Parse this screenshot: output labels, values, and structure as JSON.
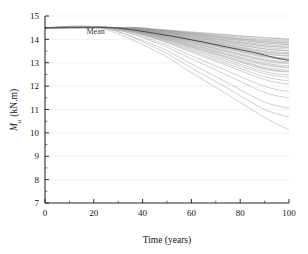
{
  "chart_data": {
    "type": "line",
    "title": "",
    "xlabel": "Time (years)",
    "ylabel": "M_u (kN.m)",
    "ylabel_parts": {
      "symbol": "M",
      "subscript": "u",
      "units": "(kN.m)"
    },
    "xlim": [
      0,
      100
    ],
    "ylim": [
      7,
      15
    ],
    "xticks": [
      0,
      20,
      40,
      60,
      80,
      100
    ],
    "yticks": [
      7,
      8,
      9,
      10,
      11,
      12,
      13,
      14,
      15
    ],
    "xtick_labels": [
      "0",
      "20",
      "40",
      "60",
      "80",
      "100"
    ],
    "ytick_labels": [
      "7",
      "8",
      "9",
      "10",
      "11",
      "12",
      "13",
      "14",
      "15"
    ],
    "x_minor_interval": 10,
    "y_minor_interval": 0.5,
    "grid": {
      "horizontal": true,
      "vertical": false,
      "color": "#e8eef2"
    },
    "legend": {
      "position": "inline-annotation",
      "entries": [
        "Mean"
      ]
    },
    "annotations": [
      {
        "text": "Mean",
        "x": 17,
        "y": 14.22
      }
    ],
    "initial_value": 14.5,
    "colors": {
      "samples": "#9a9a9a",
      "mean": "#4a4a4a",
      "axis": "#2b2b2b"
    },
    "series": [
      {
        "name": "Mean",
        "emphasis": true,
        "onset": 28,
        "x": [
          0,
          10,
          20,
          28,
          35,
          45,
          55,
          65,
          75,
          85,
          95,
          100
        ],
        "values": [
          14.5,
          14.5,
          14.5,
          14.5,
          14.42,
          14.26,
          14.08,
          13.88,
          13.66,
          13.45,
          13.2,
          13.1
        ]
      },
      {
        "name": "sample-1",
        "onset": 34,
        "x": [
          0,
          34,
          45,
          60,
          75,
          90,
          100
        ],
        "values": [
          14.5,
          14.5,
          14.43,
          14.3,
          14.18,
          14.06,
          14.0
        ]
      },
      {
        "name": "sample-2",
        "onset": 33,
        "x": [
          0,
          33,
          45,
          60,
          75,
          90,
          100
        ],
        "values": [
          14.5,
          14.5,
          14.42,
          14.28,
          14.14,
          14.0,
          13.95
        ]
      },
      {
        "name": "sample-3",
        "onset": 35,
        "x": [
          0,
          35,
          45,
          60,
          75,
          90,
          100
        ],
        "values": [
          14.5,
          14.5,
          14.42,
          14.27,
          14.1,
          13.96,
          13.9
        ]
      },
      {
        "name": "sample-4",
        "onset": 32,
        "x": [
          0,
          32,
          45,
          60,
          75,
          90,
          100
        ],
        "values": [
          14.5,
          14.5,
          14.4,
          14.24,
          14.06,
          13.9,
          13.84
        ]
      },
      {
        "name": "sample-5",
        "onset": 31,
        "x": [
          0,
          31,
          45,
          60,
          75,
          90,
          100
        ],
        "values": [
          14.5,
          14.5,
          14.38,
          14.2,
          14.01,
          13.84,
          13.78
        ]
      },
      {
        "name": "sample-6",
        "onset": 33,
        "x": [
          0,
          33,
          45,
          60,
          75,
          90,
          100
        ],
        "values": [
          14.5,
          14.5,
          14.38,
          14.18,
          13.97,
          13.78,
          13.72
        ]
      },
      {
        "name": "sample-7",
        "onset": 30,
        "x": [
          0,
          30,
          45,
          60,
          75,
          90,
          100
        ],
        "values": [
          14.5,
          14.5,
          14.36,
          14.15,
          13.92,
          13.72,
          13.65
        ]
      },
      {
        "name": "sample-8",
        "onset": 32,
        "x": [
          0,
          32,
          45,
          60,
          75,
          90,
          100
        ],
        "values": [
          14.5,
          14.5,
          14.35,
          14.12,
          13.88,
          13.66,
          13.58
        ]
      },
      {
        "name": "sample-9",
        "onset": 29,
        "x": [
          0,
          29,
          45,
          60,
          75,
          90,
          100
        ],
        "values": [
          14.5,
          14.5,
          14.33,
          14.09,
          13.83,
          13.59,
          13.5
        ]
      },
      {
        "name": "sample-10",
        "onset": 31,
        "x": [
          0,
          31,
          45,
          60,
          75,
          90,
          100
        ],
        "values": [
          14.5,
          14.5,
          14.32,
          14.06,
          13.78,
          13.52,
          13.43
        ]
      },
      {
        "name": "sample-11",
        "onset": 30,
        "x": [
          0,
          30,
          45,
          60,
          75,
          90,
          100
        ],
        "values": [
          14.5,
          14.5,
          14.3,
          14.02,
          13.73,
          13.45,
          13.36
        ]
      },
      {
        "name": "sample-12",
        "onset": 28,
        "x": [
          0,
          28,
          45,
          60,
          75,
          90,
          100
        ],
        "values": [
          14.5,
          14.5,
          14.28,
          13.99,
          13.68,
          13.38,
          13.28
        ]
      },
      {
        "name": "sample-13",
        "onset": 30,
        "x": [
          0,
          30,
          45,
          60,
          75,
          90,
          100
        ],
        "values": [
          14.5,
          14.5,
          14.27,
          13.95,
          13.62,
          13.3,
          13.2
        ]
      },
      {
        "name": "sample-14",
        "onset": 28,
        "x": [
          0,
          28,
          45,
          60,
          75,
          90,
          100
        ],
        "values": [
          14.5,
          14.5,
          14.25,
          13.92,
          13.57,
          13.23,
          13.12
        ]
      },
      {
        "name": "sample-15",
        "onset": 29,
        "x": [
          0,
          29,
          45,
          60,
          75,
          90,
          100
        ],
        "values": [
          14.5,
          14.5,
          14.23,
          13.88,
          13.51,
          13.15,
          13.04
        ]
      },
      {
        "name": "sample-16",
        "onset": 27,
        "x": [
          0,
          27,
          45,
          60,
          75,
          90,
          100
        ],
        "values": [
          14.5,
          14.5,
          14.21,
          13.84,
          13.45,
          13.07,
          12.95
        ]
      },
      {
        "name": "sample-17",
        "onset": 29,
        "x": [
          0,
          29,
          45,
          60,
          75,
          90,
          100
        ],
        "values": [
          14.5,
          14.5,
          14.19,
          13.8,
          13.39,
          12.99,
          12.87
        ]
      },
      {
        "name": "sample-18",
        "onset": 27,
        "x": [
          0,
          27,
          45,
          60,
          75,
          90,
          100
        ],
        "values": [
          14.5,
          14.5,
          14.17,
          13.75,
          13.32,
          12.9,
          12.78
        ]
      },
      {
        "name": "sample-19",
        "onset": 28,
        "x": [
          0,
          28,
          45,
          60,
          75,
          90,
          100
        ],
        "values": [
          14.5,
          14.5,
          14.15,
          13.71,
          13.26,
          12.81,
          12.68
        ]
      },
      {
        "name": "sample-20",
        "onset": 26,
        "x": [
          0,
          26,
          45,
          60,
          75,
          90,
          100
        ],
        "values": [
          14.5,
          14.5,
          14.12,
          13.66,
          13.19,
          12.72,
          12.6
        ]
      },
      {
        "name": "sample-21",
        "onset": 27,
        "x": [
          0,
          27,
          45,
          60,
          75,
          90,
          100
        ],
        "values": [
          14.5,
          14.5,
          14.1,
          13.61,
          13.11,
          12.62,
          12.48
        ]
      },
      {
        "name": "sample-22",
        "onset": 26,
        "x": [
          0,
          26,
          45,
          60,
          75,
          90,
          100
        ],
        "values": [
          14.5,
          14.5,
          14.07,
          13.56,
          13.04,
          12.53,
          12.38
        ]
      },
      {
        "name": "sample-23",
        "onset": 25,
        "x": [
          0,
          25,
          45,
          60,
          75,
          90,
          100
        ],
        "values": [
          14.5,
          14.5,
          14.05,
          13.5,
          12.95,
          12.4,
          12.22
        ]
      },
      {
        "name": "sample-24",
        "onset": 34,
        "x": [
          0,
          34,
          45,
          60,
          75,
          90,
          100
        ],
        "values": [
          14.5,
          14.5,
          14.4,
          14.22,
          14.03,
          13.85,
          13.78
        ]
      },
      {
        "name": "sample-25",
        "onset": 36,
        "x": [
          0,
          36,
          45,
          60,
          75,
          90,
          100
        ],
        "values": [
          14.5,
          14.5,
          14.44,
          14.32,
          14.2,
          14.08,
          14.02
        ]
      },
      {
        "name": "sample-26",
        "onset": 35,
        "x": [
          0,
          35,
          45,
          60,
          75,
          90,
          100
        ],
        "values": [
          14.5,
          14.5,
          14.41,
          14.25,
          14.08,
          13.92,
          13.86
        ]
      },
      {
        "name": "sample-27",
        "onset": 33,
        "x": [
          0,
          33,
          45,
          60,
          75,
          90,
          100
        ],
        "values": [
          14.5,
          14.5,
          14.37,
          14.16,
          13.94,
          13.73,
          13.66
        ]
      },
      {
        "name": "sample-28",
        "onset": 31,
        "x": [
          0,
          31,
          45,
          60,
          75,
          90,
          100
        ],
        "values": [
          14.5,
          14.5,
          14.34,
          14.1,
          13.85,
          13.6,
          13.52
        ]
      },
      {
        "name": "sample-29",
        "onset": 30,
        "x": [
          0,
          30,
          45,
          60,
          75,
          90,
          100
        ],
        "values": [
          14.5,
          14.5,
          14.31,
          14.04,
          13.76,
          13.48,
          13.39
        ]
      },
      {
        "name": "sample-30",
        "onset": 29,
        "x": [
          0,
          29,
          45,
          60,
          75,
          90,
          100
        ],
        "values": [
          14.5,
          14.5,
          14.26,
          13.93,
          13.6,
          13.27,
          13.16
        ]
      },
      {
        "name": "sample-31",
        "onset": 28,
        "x": [
          0,
          28,
          45,
          60,
          75,
          90,
          100
        ],
        "values": [
          14.5,
          14.5,
          14.22,
          13.86,
          13.48,
          13.11,
          12.99
        ]
      },
      {
        "name": "sample-32",
        "onset": 27,
        "x": [
          0,
          27,
          45,
          60,
          75,
          90,
          100
        ],
        "values": [
          14.5,
          14.5,
          14.18,
          13.77,
          13.35,
          12.94,
          12.8
        ]
      },
      {
        "name": "sample-33",
        "onset": 26,
        "x": [
          0,
          26,
          45,
          60,
          75,
          90,
          100
        ],
        "values": [
          14.5,
          14.5,
          14.13,
          13.68,
          13.22,
          12.76,
          12.62
        ]
      },
      {
        "name": "sample-34",
        "onset": 25,
        "x": [
          0,
          25,
          45,
          60,
          75,
          90,
          100
        ],
        "values": [
          14.5,
          14.5,
          14.03,
          13.45,
          12.87,
          12.28,
          12.08
        ]
      },
      {
        "name": "sample-35",
        "onset": 24,
        "x": [
          0,
          24,
          45,
          60,
          75,
          90,
          100
        ],
        "values": [
          14.5,
          14.5,
          13.95,
          13.3,
          12.64,
          11.99,
          11.77
        ]
      },
      {
        "name": "sample-36",
        "onset": 25,
        "x": [
          0,
          25,
          45,
          60,
          75,
          90,
          100
        ],
        "values": [
          14.5,
          14.5,
          13.88,
          13.17,
          12.45,
          11.73,
          11.49
        ]
      },
      {
        "name": "sample-37",
        "onset": 23,
        "x": [
          0,
          23,
          45,
          60,
          75,
          90,
          100
        ],
        "values": [
          14.5,
          14.5,
          13.75,
          12.95,
          12.13,
          11.32,
          11.05
        ]
      },
      {
        "name": "sample-38",
        "onset": 24,
        "x": [
          0,
          24,
          45,
          60,
          75,
          90,
          100
        ],
        "values": [
          14.5,
          14.5,
          13.65,
          12.78,
          11.9,
          11.0,
          10.68
        ]
      },
      {
        "name": "sample-39",
        "onset": 22,
        "x": [
          0,
          22,
          45,
          60,
          75,
          90,
          100
        ],
        "values": [
          14.5,
          14.5,
          13.52,
          12.58,
          11.63,
          10.66,
          10.12
        ]
      },
      {
        "name": "sample-40",
        "onset": 30,
        "x": [
          0,
          30,
          45,
          60,
          75,
          90,
          100
        ],
        "values": [
          14.5,
          14.5,
          14.29,
          14.0,
          13.7,
          13.4,
          13.3
        ]
      }
    ]
  }
}
